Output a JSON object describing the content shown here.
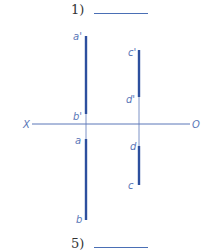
{
  "question_top": {
    "label": "1)"
  },
  "question_bottom": {
    "label": "5)"
  },
  "axis": {
    "left_label": "X",
    "right_label": "O"
  },
  "labels": {
    "a_prime": "a'",
    "b_prime": "b'",
    "c_prime": "c'",
    "d_prime": "d'",
    "a": "a",
    "b": "b",
    "c": "c",
    "d": "d"
  },
  "colors": {
    "line": "#2d4f9e",
    "thin": "#5a77b8"
  }
}
